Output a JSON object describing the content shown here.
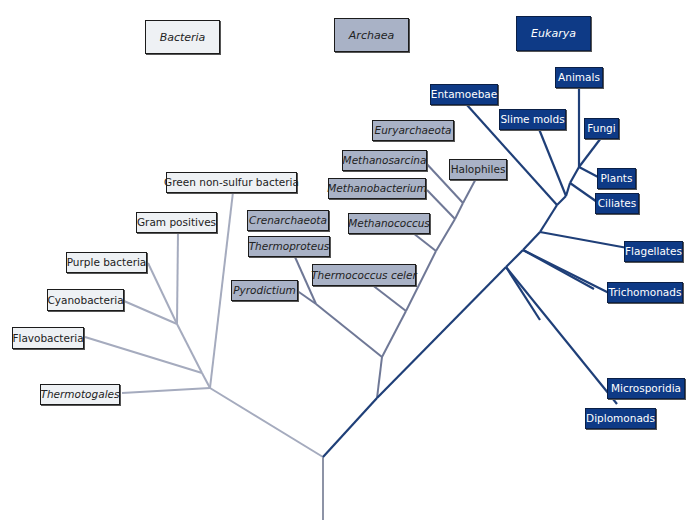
{
  "colors": {
    "bacteria_fill": "#eef1f4",
    "archaea_fill": "#a9b2c6",
    "eukarya_fill": "#0e3a86",
    "bacteria_line": "#a5abbe",
    "archaea_line": "#6f7896",
    "eukarya_line": "#1f3f78"
  },
  "domains": [
    {
      "key": "bacteria",
      "label": "Bacteria"
    },
    {
      "key": "archaea",
      "label": "Archaea"
    },
    {
      "key": "eukarya",
      "label": "Eukarya"
    }
  ],
  "bacteria": {
    "groups": [
      {
        "label": "Green non-sulfur bacteria",
        "italic": false
      },
      {
        "label": "Gram positives",
        "italic": false
      },
      {
        "label": "Purple bacteria",
        "italic": false
      },
      {
        "label": "Cyanobacteria",
        "italic": false
      },
      {
        "label": "Flavobacteria",
        "italic": false
      },
      {
        "label": "Thermotogales",
        "italic": true
      }
    ]
  },
  "archaea": {
    "groups": [
      {
        "label": "Euryarchaeota",
        "italic": true
      },
      {
        "label": "Methanosarcina",
        "italic": true
      },
      {
        "label": "Methanobacterium",
        "italic": true
      },
      {
        "label": "Halophiles",
        "italic": false
      },
      {
        "label": "Crenarchaeota",
        "italic": true
      },
      {
        "label": "Thermoproteus",
        "italic": true
      },
      {
        "label": "Methanococcus",
        "italic": true
      },
      {
        "label": "Thermococcus celer",
        "italic": true
      },
      {
        "label": "Pyrodictium",
        "italic": true
      }
    ]
  },
  "eukarya": {
    "groups": [
      {
        "label": "Entamoebae"
      },
      {
        "label": "Slime molds"
      },
      {
        "label": "Animals"
      },
      {
        "label": "Fungi"
      },
      {
        "label": "Plants"
      },
      {
        "label": "Ciliates"
      },
      {
        "label": "Flagellates"
      },
      {
        "label": "Trichomonads"
      },
      {
        "label": "Microsporidia"
      },
      {
        "label": "Diplomonads"
      }
    ]
  }
}
